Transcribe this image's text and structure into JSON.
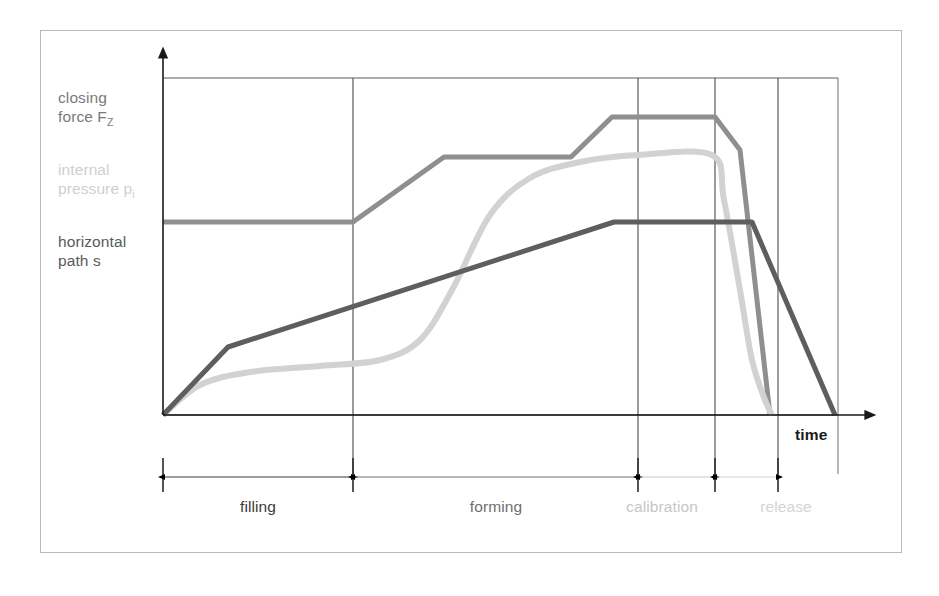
{
  "figure": {
    "background_color": "#ffffff",
    "frame_color": "#b9b9b9"
  },
  "legend": {
    "items": [
      {
        "id": "closing-force",
        "text_line1": "closing",
        "text_line2": "force F",
        "subscript": "Z",
        "color": "#8f8f8f"
      },
      {
        "id": "internal-pressure",
        "text_line1": "internal",
        "text_line2": "pressure p",
        "subscript": "i",
        "color": "#d2d2d2"
      },
      {
        "id": "horizontal-path",
        "text_line1": "horizontal",
        "text_line2": "path s",
        "subscript": "",
        "color": "#5e5e5e"
      }
    ]
  },
  "axes": {
    "x_axis_label": "time",
    "y_axis_label": "",
    "origin": {
      "x": 163,
      "y": 415
    },
    "x_arrow_end": 866,
    "y_arrow_top": 57,
    "top_gridline_y": 78,
    "grid": true
  },
  "phases": [
    {
      "name": "filling",
      "label": "filling",
      "color": "#3a3a3a",
      "x_start": 163,
      "x_end": 353,
      "label_center": 258
    },
    {
      "name": "forming",
      "label": "forming",
      "color": "#6f6f6f",
      "x_start": 353,
      "x_end": 638,
      "label_center": 496
    },
    {
      "name": "calibration",
      "label": "calibration",
      "color": "#c6c6c6",
      "x_start": 638,
      "x_end": 715,
      "label_center": 662
    },
    {
      "name": "release",
      "label": "release",
      "color": "#d4d4d4",
      "x_start": 715,
      "x_end": 778,
      "label_center": 786
    }
  ],
  "gridlines": {
    "vertical_x": [
      353,
      638,
      715,
      778,
      838
    ],
    "horizontal_y": [
      78,
      415
    ]
  },
  "chart_data": {
    "type": "line",
    "title": "",
    "xlabel": "time",
    "ylabel": "",
    "xlim": [
      0,
      1
    ],
    "ylim": [
      0,
      1
    ],
    "grid": true,
    "legend_position": "left-outside",
    "annotations": [
      "filling",
      "forming",
      "calibration",
      "release"
    ],
    "series": [
      {
        "name": "closing force F_Z",
        "color": "#8f8f8f",
        "line_width": 5,
        "points": [
          [
            163,
            222
          ],
          [
            353,
            222
          ],
          [
            444,
            157
          ],
          [
            571,
            157
          ],
          [
            612,
            117
          ],
          [
            715,
            117
          ],
          [
            740,
            150
          ],
          [
            770,
            415
          ]
        ],
        "description": "Step-wise rising plateau: holds at low level through filling, rises during forming to a mid plateau, steps up to a high plateau through calibration, then drops steeply to zero during release."
      },
      {
        "name": "internal pressure p_i",
        "color": "#d2d2d2",
        "line_width": 6,
        "points": [
          [
            163,
            415
          ],
          [
            200,
            385
          ],
          [
            250,
            372
          ],
          [
            320,
            366
          ],
          [
            380,
            360
          ],
          [
            420,
            340
          ],
          [
            452,
            290
          ],
          [
            490,
            215
          ],
          [
            530,
            178
          ],
          [
            580,
            162
          ],
          [
            638,
            155
          ],
          [
            712,
            155
          ],
          [
            724,
            200
          ],
          [
            740,
            290
          ],
          [
            752,
            360
          ],
          [
            765,
            400
          ],
          [
            772,
            415
          ]
        ],
        "description": "Smooth S-shaped curve: slow rise during filling, steep sigmoid rise during forming, plateau through calibration at a level just below the closing force, then rapid decay to zero in release."
      },
      {
        "name": "horizontal path s",
        "color": "#5e5e5e",
        "line_width": 5,
        "points": [
          [
            163,
            415
          ],
          [
            228,
            347
          ],
          [
            614,
            222
          ],
          [
            752,
            222
          ],
          [
            835,
            415
          ]
        ],
        "description": "Steep initial rise during filling, then a long steady linear climb through forming, flat plateau through calibration and into release, then a linear drop to zero at the end of release."
      }
    ]
  }
}
